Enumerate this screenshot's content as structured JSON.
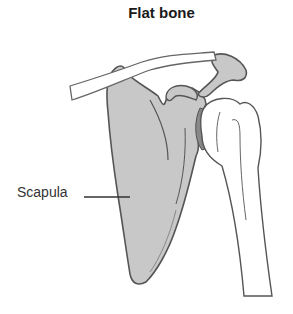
{
  "title": "Flat bone",
  "labels": {
    "scapula": "Scapula"
  },
  "colors": {
    "bone_fill": "#c8c8c8",
    "outline": "#555555",
    "background": "#ffffff"
  }
}
